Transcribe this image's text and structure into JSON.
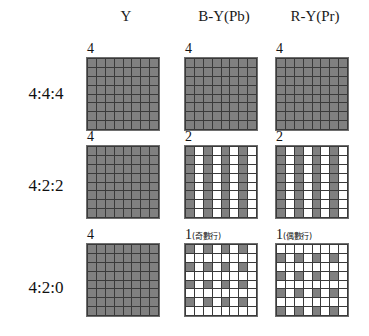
{
  "colors": {
    "sample_gray": "#808080",
    "empty_white": "#ffffff",
    "gridline": "#3a3a3a",
    "text": "#141414",
    "background": "#ffffff"
  },
  "headers": {
    "luma": "Y",
    "chroma_b": "B-Y(Pb)",
    "chroma_r": "R-Y(Pr)"
  },
  "rows": [
    {
      "label": "4:4:4"
    },
    {
      "label": "4:2:2"
    },
    {
      "label": "4:2:0"
    }
  ],
  "cells": {
    "r0c0": {
      "count": "4",
      "note": ""
    },
    "r0c1": {
      "count": "4",
      "note": ""
    },
    "r0c2": {
      "count": "4",
      "note": ""
    },
    "r1c0": {
      "count": "4",
      "note": ""
    },
    "r1c1": {
      "count": "2",
      "note": ""
    },
    "r1c2": {
      "count": "2",
      "note": ""
    },
    "r2c0": {
      "count": "4",
      "note": ""
    },
    "r2c1": {
      "count": "1",
      "note": "(奇數行)"
    },
    "r2c2": {
      "count": "1",
      "note": "(偶數行)"
    }
  },
  "chart_data": {
    "type": "heatmap",
    "xlabel": "",
    "ylabel": "",
    "grid_size": [
      8,
      8
    ],
    "value_legend": {
      "1": "sampled (gray)",
      "0": "not sampled (white)"
    },
    "columns": [
      "Y",
      "B-Y(Pb)",
      "R-Y(Pr)"
    ],
    "row_categories": [
      "4:4:4",
      "4:2:2",
      "4:2:0"
    ],
    "panels": [
      {
        "row": "4:4:4",
        "column": "Y",
        "count_label": "4",
        "note": "",
        "matrix": [
          [
            1,
            1,
            1,
            1,
            1,
            1,
            1,
            1
          ],
          [
            1,
            1,
            1,
            1,
            1,
            1,
            1,
            1
          ],
          [
            1,
            1,
            1,
            1,
            1,
            1,
            1,
            1
          ],
          [
            1,
            1,
            1,
            1,
            1,
            1,
            1,
            1
          ],
          [
            1,
            1,
            1,
            1,
            1,
            1,
            1,
            1
          ],
          [
            1,
            1,
            1,
            1,
            1,
            1,
            1,
            1
          ],
          [
            1,
            1,
            1,
            1,
            1,
            1,
            1,
            1
          ],
          [
            1,
            1,
            1,
            1,
            1,
            1,
            1,
            1
          ]
        ]
      },
      {
        "row": "4:4:4",
        "column": "B-Y(Pb)",
        "count_label": "4",
        "note": "",
        "matrix": [
          [
            1,
            1,
            1,
            1,
            1,
            1,
            1,
            1
          ],
          [
            1,
            1,
            1,
            1,
            1,
            1,
            1,
            1
          ],
          [
            1,
            1,
            1,
            1,
            1,
            1,
            1,
            1
          ],
          [
            1,
            1,
            1,
            1,
            1,
            1,
            1,
            1
          ],
          [
            1,
            1,
            1,
            1,
            1,
            1,
            1,
            1
          ],
          [
            1,
            1,
            1,
            1,
            1,
            1,
            1,
            1
          ],
          [
            1,
            1,
            1,
            1,
            1,
            1,
            1,
            1
          ],
          [
            1,
            1,
            1,
            1,
            1,
            1,
            1,
            1
          ]
        ]
      },
      {
        "row": "4:4:4",
        "column": "R-Y(Pr)",
        "count_label": "4",
        "note": "",
        "matrix": [
          [
            1,
            1,
            1,
            1,
            1,
            1,
            1,
            1
          ],
          [
            1,
            1,
            1,
            1,
            1,
            1,
            1,
            1
          ],
          [
            1,
            1,
            1,
            1,
            1,
            1,
            1,
            1
          ],
          [
            1,
            1,
            1,
            1,
            1,
            1,
            1,
            1
          ],
          [
            1,
            1,
            1,
            1,
            1,
            1,
            1,
            1
          ],
          [
            1,
            1,
            1,
            1,
            1,
            1,
            1,
            1
          ],
          [
            1,
            1,
            1,
            1,
            1,
            1,
            1,
            1
          ],
          [
            1,
            1,
            1,
            1,
            1,
            1,
            1,
            1
          ]
        ]
      },
      {
        "row": "4:2:2",
        "column": "Y",
        "count_label": "4",
        "note": "",
        "matrix": [
          [
            1,
            1,
            1,
            1,
            1,
            1,
            1,
            1
          ],
          [
            1,
            1,
            1,
            1,
            1,
            1,
            1,
            1
          ],
          [
            1,
            1,
            1,
            1,
            1,
            1,
            1,
            1
          ],
          [
            1,
            1,
            1,
            1,
            1,
            1,
            1,
            1
          ],
          [
            1,
            1,
            1,
            1,
            1,
            1,
            1,
            1
          ],
          [
            1,
            1,
            1,
            1,
            1,
            1,
            1,
            1
          ],
          [
            1,
            1,
            1,
            1,
            1,
            1,
            1,
            1
          ],
          [
            1,
            1,
            1,
            1,
            1,
            1,
            1,
            1
          ]
        ]
      },
      {
        "row": "4:2:2",
        "column": "B-Y(Pb)",
        "count_label": "2",
        "note": "",
        "matrix": [
          [
            1,
            0,
            1,
            0,
            1,
            0,
            1,
            0
          ],
          [
            1,
            0,
            1,
            0,
            1,
            0,
            1,
            0
          ],
          [
            1,
            0,
            1,
            0,
            1,
            0,
            1,
            0
          ],
          [
            1,
            0,
            1,
            0,
            1,
            0,
            1,
            0
          ],
          [
            1,
            0,
            1,
            0,
            1,
            0,
            1,
            0
          ],
          [
            1,
            0,
            1,
            0,
            1,
            0,
            1,
            0
          ],
          [
            1,
            0,
            1,
            0,
            1,
            0,
            1,
            0
          ],
          [
            1,
            0,
            1,
            0,
            1,
            0,
            1,
            0
          ]
        ]
      },
      {
        "row": "4:2:2",
        "column": "R-Y(Pr)",
        "count_label": "2",
        "note": "",
        "matrix": [
          [
            1,
            0,
            1,
            0,
            1,
            0,
            1,
            0
          ],
          [
            1,
            0,
            1,
            0,
            1,
            0,
            1,
            0
          ],
          [
            1,
            0,
            1,
            0,
            1,
            0,
            1,
            0
          ],
          [
            1,
            0,
            1,
            0,
            1,
            0,
            1,
            0
          ],
          [
            1,
            0,
            1,
            0,
            1,
            0,
            1,
            0
          ],
          [
            1,
            0,
            1,
            0,
            1,
            0,
            1,
            0
          ],
          [
            1,
            0,
            1,
            0,
            1,
            0,
            1,
            0
          ],
          [
            1,
            0,
            1,
            0,
            1,
            0,
            1,
            0
          ]
        ]
      },
      {
        "row": "4:2:0",
        "column": "Y",
        "count_label": "4",
        "note": "",
        "matrix": [
          [
            1,
            1,
            1,
            1,
            1,
            1,
            1,
            1
          ],
          [
            1,
            1,
            1,
            1,
            1,
            1,
            1,
            1
          ],
          [
            1,
            1,
            1,
            1,
            1,
            1,
            1,
            1
          ],
          [
            1,
            1,
            1,
            1,
            1,
            1,
            1,
            1
          ],
          [
            1,
            1,
            1,
            1,
            1,
            1,
            1,
            1
          ],
          [
            1,
            1,
            1,
            1,
            1,
            1,
            1,
            1
          ],
          [
            1,
            1,
            1,
            1,
            1,
            1,
            1,
            1
          ],
          [
            1,
            1,
            1,
            1,
            1,
            1,
            1,
            1
          ]
        ]
      },
      {
        "row": "4:2:0",
        "column": "B-Y(Pb)",
        "count_label": "1",
        "note": "(奇數行)",
        "matrix": [
          [
            1,
            0,
            1,
            0,
            1,
            0,
            1,
            0
          ],
          [
            0,
            0,
            0,
            0,
            0,
            0,
            0,
            0
          ],
          [
            1,
            0,
            1,
            0,
            1,
            0,
            1,
            0
          ],
          [
            0,
            0,
            0,
            0,
            0,
            0,
            0,
            0
          ],
          [
            1,
            0,
            1,
            0,
            1,
            0,
            1,
            0
          ],
          [
            0,
            0,
            0,
            0,
            0,
            0,
            0,
            0
          ],
          [
            1,
            0,
            1,
            0,
            1,
            0,
            1,
            0
          ],
          [
            0,
            0,
            0,
            0,
            0,
            0,
            0,
            0
          ]
        ]
      },
      {
        "row": "4:2:0",
        "column": "R-Y(Pr)",
        "count_label": "1",
        "note": "(偶數行)",
        "matrix": [
          [
            0,
            0,
            0,
            0,
            0,
            0,
            0,
            0
          ],
          [
            1,
            0,
            1,
            0,
            1,
            0,
            1,
            0
          ],
          [
            0,
            0,
            0,
            0,
            0,
            0,
            0,
            0
          ],
          [
            1,
            0,
            1,
            0,
            1,
            0,
            1,
            0
          ],
          [
            0,
            0,
            0,
            0,
            0,
            0,
            0,
            0
          ],
          [
            1,
            0,
            1,
            0,
            1,
            0,
            1,
            0
          ],
          [
            0,
            0,
            0,
            0,
            0,
            0,
            0,
            0
          ],
          [
            1,
            0,
            1,
            0,
            1,
            0,
            1,
            0
          ]
        ]
      }
    ]
  }
}
